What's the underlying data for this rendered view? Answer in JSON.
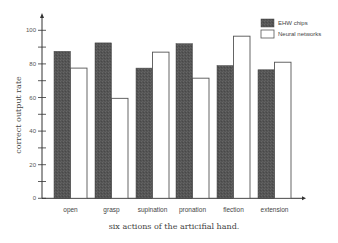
{
  "chart_data": {
    "type": "bar",
    "title": "",
    "xlabel": "six actions of the articifial hand.",
    "ylabel": "correct output rate",
    "ylim": [
      0,
      100
    ],
    "yticks": [
      0,
      20,
      40,
      60,
      80,
      100
    ],
    "minor_ticks": [
      10,
      30,
      50,
      70,
      90
    ],
    "grid": false,
    "legend_position": "top-right",
    "categories": [
      "open",
      "grasp",
      "supination",
      "pronation",
      "flection",
      "extension"
    ],
    "series": [
      {
        "name": "EHW chips",
        "color": "#555555",
        "values": [
          87.5,
          92.5,
          77.5,
          92,
          79,
          76.5
        ]
      },
      {
        "name": "Neural networks",
        "color": "#ffffff",
        "values": [
          77.5,
          59.5,
          87,
          71.5,
          96.5,
          81
        ]
      }
    ]
  }
}
